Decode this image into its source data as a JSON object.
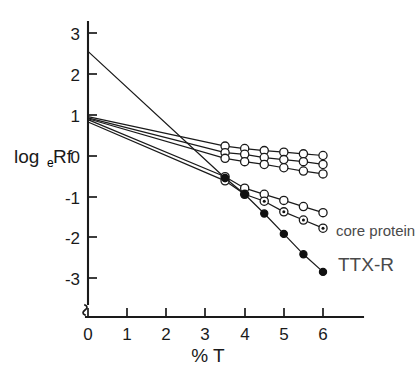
{
  "figure": {
    "background_color": "#ffffff",
    "ink_color": "#1a1a1a",
    "annotation_color": "#4a4a4a"
  },
  "axes": {
    "y_title_main": "log",
    "y_title_sub": "e",
    "y_title_tail": "Rf",
    "x_title": "% T",
    "y_ticks": [
      "3",
      "2",
      "1",
      "0",
      "-1",
      "-2",
      "-3"
    ],
    "x_ticks": [
      "0",
      "1",
      "2",
      "3",
      "4",
      "5",
      "6"
    ]
  },
  "annotations": {
    "core_protein": "core protein",
    "ttx_r": "TTX-R"
  },
  "chart_data": {
    "type": "line",
    "title": "",
    "xlabel": "% T",
    "ylabel": "log_e Rf",
    "xlim": [
      0,
      6.6
    ],
    "ylim": [
      -3.4,
      3.4
    ],
    "grid": false,
    "legend_position": "inline-right",
    "x_tick_values": [
      0,
      1,
      2,
      3,
      4,
      5,
      6
    ],
    "y_tick_values": [
      3,
      2,
      1,
      0,
      -1,
      -2,
      -3
    ],
    "series": [
      {
        "name": "series-1-open",
        "marker": "open-circle",
        "label": "",
        "intercept_y": 0.95,
        "x": [
          0,
          3.5,
          4.0,
          4.5,
          5.0,
          5.5,
          6.0
        ],
        "y": [
          0.95,
          0.23,
          0.17,
          0.12,
          0.08,
          0.04,
          0.0
        ],
        "has_marker_at_intercept": false
      },
      {
        "name": "series-2-open",
        "marker": "open-circle",
        "label": "",
        "intercept_y": 0.92,
        "x": [
          0,
          3.5,
          4.0,
          4.5,
          5.0,
          5.5,
          6.0
        ],
        "y": [
          0.92,
          0.07,
          0.03,
          -0.05,
          -0.1,
          -0.15,
          -0.22
        ],
        "has_marker_at_intercept": false
      },
      {
        "name": "series-3-open",
        "marker": "open-circle",
        "label": "",
        "intercept_y": 0.9,
        "x": [
          0,
          3.5,
          4.0,
          4.5,
          5.0,
          5.5,
          6.0
        ],
        "y": [
          0.9,
          -0.07,
          -0.15,
          -0.22,
          -0.3,
          -0.38,
          -0.45
        ],
        "has_marker_at_intercept": false
      },
      {
        "name": "series-4-open",
        "marker": "open-circle",
        "label": "",
        "intercept_y": 0.88,
        "x": [
          0,
          3.5,
          4.0,
          4.5,
          5.0,
          5.5,
          6.0
        ],
        "y": [
          0.88,
          -0.52,
          -0.8,
          -0.95,
          -1.1,
          -1.25,
          -1.4
        ],
        "has_marker_at_intercept": false
      },
      {
        "name": "series-5-core-protein",
        "marker": "dotted-circle",
        "label": "core protein",
        "intercept_y": 0.82,
        "x": [
          0,
          3.5,
          4.0,
          4.5,
          5.0,
          5.5,
          6.0
        ],
        "y": [
          0.82,
          -0.62,
          -0.95,
          -1.12,
          -1.38,
          -1.58,
          -1.78
        ],
        "has_marker_at_intercept": false
      },
      {
        "name": "series-6-ttx-r",
        "marker": "filled-circle",
        "label": "TTX-R",
        "intercept_y": 2.55,
        "x": [
          0,
          3.5,
          4.0,
          4.5,
          5.0,
          5.5,
          6.0
        ],
        "y": [
          2.55,
          -0.55,
          -0.95,
          -1.42,
          -1.92,
          -2.42,
          -2.85
        ],
        "has_marker_at_intercept": false
      }
    ]
  }
}
